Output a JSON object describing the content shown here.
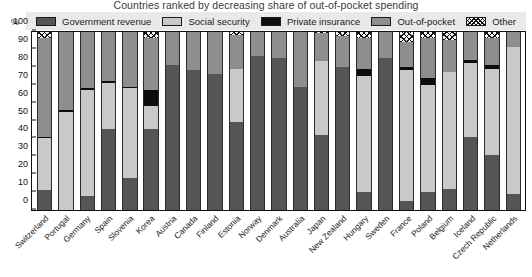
{
  "chart_data": {
    "type": "bar",
    "subtype": "stacked-bar-100-percent",
    "title": "Countries ranked by decreasing share of out-of-pocket spending",
    "xlabel": "",
    "ylabel": "%",
    "ylim": [
      0,
      100
    ],
    "yticks": [
      0,
      10,
      20,
      30,
      40,
      50,
      60,
      70,
      80,
      90,
      100
    ],
    "grid": false,
    "legend_position": "top",
    "categories": [
      "Switzerland",
      "Portugal",
      "Germany",
      "Spain",
      "Slovenia",
      "Korea",
      "Austria",
      "Canada",
      "Finland",
      "Estonia",
      "Norway",
      "Denmark",
      "Australia",
      "Japan",
      "New Zealand",
      "Hungary",
      "Sweden",
      "France",
      "Poland",
      "Belgium",
      "Iceland",
      "Czech Republic",
      "Netherlands"
    ],
    "series": [
      {
        "name": "Government revenue",
        "color": "#555555",
        "values": [
          11,
          0,
          8,
          45,
          18,
          45,
          81,
          78,
          76,
          49,
          86,
          85,
          69,
          42,
          80,
          10,
          85,
          5,
          10,
          12,
          41,
          31,
          9
        ]
      },
      {
        "name": "Social security",
        "color": "#c9c9c9",
        "values": [
          29,
          55,
          59,
          26,
          50,
          13,
          0,
          0,
          0,
          30,
          0,
          0,
          0,
          41,
          0,
          65,
          0,
          73,
          60,
          65,
          41,
          48,
          82
        ]
      },
      {
        "name": "Private insurance",
        "color": "#0d0d0d",
        "values": [
          1,
          1,
          1,
          1,
          1,
          9,
          0,
          0,
          0,
          0,
          0,
          0,
          0,
          0,
          0,
          4,
          0,
          2,
          4,
          0,
          2,
          2,
          0
        ]
      },
      {
        "name": "Out-of-pocket",
        "color": "#8e8e8e",
        "values": [
          55,
          44,
          32,
          28,
          31,
          29,
          19,
          22,
          24,
          19,
          14,
          15,
          31,
          16,
          17,
          17,
          15,
          14,
          22,
          18,
          16,
          15,
          9
        ]
      },
      {
        "name": "Other",
        "color": "#f2f2f2",
        "pattern": "crosshatch",
        "values": [
          4,
          0,
          0,
          0,
          0,
          4,
          0,
          0,
          0,
          2,
          0,
          0,
          0,
          1,
          3,
          4,
          0,
          6,
          4,
          5,
          0,
          4,
          0
        ]
      }
    ]
  },
  "legend": {
    "items": [
      {
        "label": "Government revenue",
        "swatch": "gov"
      },
      {
        "label": "Social security",
        "swatch": "soc"
      },
      {
        "label": "Private insurance",
        "swatch": "priv"
      },
      {
        "label": "Out-of-pocket",
        "swatch": "oop"
      },
      {
        "label": "Other",
        "swatch": "other"
      }
    ]
  },
  "axis": {
    "y_unit_label": "%"
  },
  "colors": {
    "government_revenue": "#555555",
    "social_security": "#c9c9c9",
    "private_insurance": "#0d0d0d",
    "out_of_pocket": "#8e8e8e",
    "other": "#f2f2f2",
    "legend_background": "#e9e9e9",
    "axis": "#111111"
  }
}
